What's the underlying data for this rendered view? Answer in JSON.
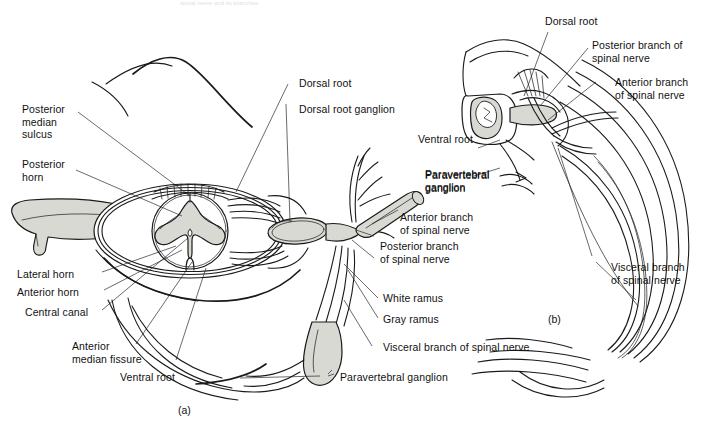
{
  "figure": {
    "title_fragment": "spinal nerve and its branches",
    "panel_a_id": "(a)",
    "panel_b_id": "(b)",
    "ink_color": "#1a1a1a",
    "fill_gray": "#d9d9d4",
    "fill_gray_dark": "#b9b9b4",
    "background": "#ffffff"
  },
  "panel_a": {
    "labels": {
      "posterior_median_sulcus": "Posterior\nmedian\nsulcus",
      "posterior_horn": "Posterior\nhorn",
      "lateral_horn": "Lateral horn",
      "anterior_horn": "Anterior horn",
      "central_canal": "Central canal",
      "anterior_median_fissure": "Anterior\nmedian fissure",
      "ventral_root": "Ventral root",
      "dorsal_root": "Dorsal root",
      "dorsal_root_ganglion": "Dorsal root ganglion",
      "paravertebral_ganglion_top": "Paravertebral\nganglion",
      "anterior_branch_of_spinal_nerve": "Anterior branch\nof spinal nerve",
      "posterior_branch_of_spinal_nerve": "Posterior branch\nof spinal nerve",
      "white_ramus": "White ramus",
      "gray_ramus": "Gray ramus",
      "visceral_branch_of_spinal_nerve": "Visceral branch of spinal nerve",
      "paravertebral_ganglion_bottom": "Paravertebral ganglion"
    }
  },
  "panel_b": {
    "labels": {
      "dorsal_root": "Dorsal root",
      "posterior_branch_of_spinal_nerve": "Posterior branch of\nspinal nerve",
      "anterior_branch_of_spinal_nerve": "Anterior branch\nof spinal nerve",
      "ventral_root": "Ventral root",
      "paravertebral_ganglion": "Paravertebral\nganglion",
      "visceral_branch_of_spinal_nerve": "Visceral branch\nof spinal nerve"
    }
  }
}
